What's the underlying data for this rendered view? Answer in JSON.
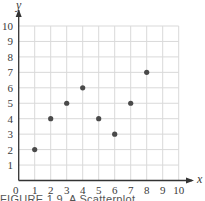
{
  "chart_data": {
    "type": "scatter",
    "title": "",
    "caption": "FIGURE 1.9  A Scatterplot",
    "xlabel": "x",
    "ylabel": "y",
    "xlim": [
      0,
      10
    ],
    "ylim": [
      0,
      10
    ],
    "xticks": [
      0,
      1,
      2,
      3,
      4,
      5,
      6,
      7,
      8,
      9,
      10
    ],
    "yticks": [
      1,
      2,
      3,
      4,
      5,
      6,
      7,
      8,
      9,
      10
    ],
    "grid": true,
    "legend": null,
    "series": [
      {
        "name": "points",
        "color": "#4a4a4a",
        "points": [
          {
            "x": 1,
            "y": 2
          },
          {
            "x": 2,
            "y": 4
          },
          {
            "x": 3,
            "y": 5
          },
          {
            "x": 4,
            "y": 6
          },
          {
            "x": 5,
            "y": 4
          },
          {
            "x": 6,
            "y": 3
          },
          {
            "x": 7,
            "y": 5
          },
          {
            "x": 8,
            "y": 7
          }
        ]
      }
    ]
  },
  "caption": {
    "figure": "FIGURE 1.9",
    "text": "A Scatterplot"
  },
  "colors": {
    "axis": "#333333",
    "grid": "#d9d9d9",
    "point": "#4a4a4a"
  }
}
